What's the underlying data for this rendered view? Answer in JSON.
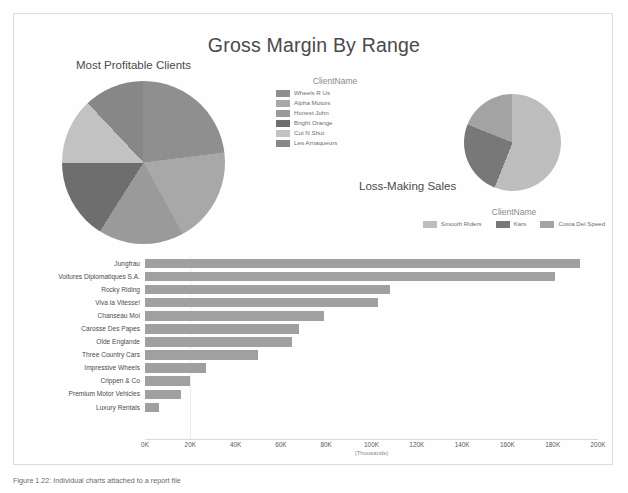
{
  "report": {
    "title": "Gross Margin By Range"
  },
  "pie_profitable": {
    "subtitle": "Most Profitable Clients",
    "legend_title": "ClientName"
  },
  "pie_loss": {
    "subtitle": "Loss-Making Sales",
    "legend_title": "ClientName"
  },
  "bar": {
    "axis_unit": "(Thousands)"
  },
  "caption": {
    "text": "Figure 1.22: Individual charts attached to a report file"
  },
  "chart_data": [
    {
      "type": "pie",
      "title": "Most Profitable Clients",
      "legend_title": "ClientName",
      "legend_position": "right",
      "categories": [
        "Wheels R Us",
        "Alpha Motors",
        "Honest John",
        "Bright Orange",
        "Cut N Shut",
        "Les Arnaqueurs"
      ],
      "values": [
        23,
        19,
        17,
        16,
        13,
        12
      ],
      "colors": [
        "#8f8f8f",
        "#a8a8a8",
        "#9a9a9a",
        "#6e6e6e",
        "#c2c2c2",
        "#878787"
      ],
      "slice_angles_deg": [
        82.8,
        68.4,
        61.2,
        57.6,
        46.8,
        43.2
      ]
    },
    {
      "type": "pie",
      "title": "Loss-Making Sales",
      "legend_title": "ClientName",
      "legend_position": "bottom",
      "categories": [
        "Smooth Riders",
        "Kars",
        "Costa Del Speed"
      ],
      "values": [
        56,
        25,
        19
      ],
      "colors": [
        "#bdbdbd",
        "#787878",
        "#a3a3a3"
      ],
      "slice_angles_deg": [
        201.6,
        90,
        68.4
      ]
    },
    {
      "type": "bar",
      "orientation": "horizontal",
      "title": "Gross Margin By Range",
      "xlabel": "(Thousands)",
      "ylabel": "",
      "xlim": [
        0,
        200
      ],
      "grid": true,
      "tick_labels": [
        "0K",
        "20K",
        "40K",
        "60K",
        "80K",
        "100K",
        "120K",
        "140K",
        "160K",
        "180K",
        "200K"
      ],
      "tick_values": [
        0,
        20,
        40,
        60,
        80,
        100,
        120,
        140,
        160,
        180,
        200
      ],
      "categories": [
        "Jungfrau",
        "Voitures Diplomatiques S.A.",
        "Rocky Riding",
        "Viva la Vitesse!",
        "Chanseau Moi",
        "Carosse Des Papes",
        "Olde Englande",
        "Three Country Cars",
        "Impressive Wheels",
        "Crippen & Co",
        "Premium Motor Vehicles",
        "Luxury Rentals"
      ],
      "values": [
        192,
        181,
        108,
        103,
        79,
        68,
        65,
        50,
        27,
        20,
        16,
        6
      ],
      "bar_color": "#a0a0a0"
    }
  ]
}
